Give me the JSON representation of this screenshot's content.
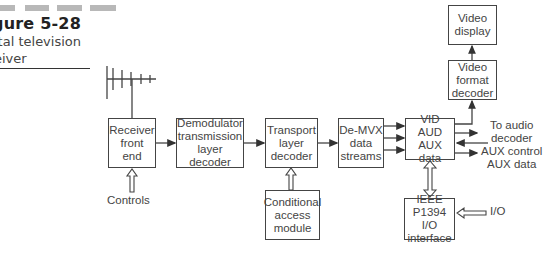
{
  "figure": {
    "title_visible": "gure 5-28",
    "caption_lines": [
      "ital television",
      "eiver"
    ]
  },
  "blocks": {
    "receiver": [
      "Receiver",
      "front",
      "end"
    ],
    "demodulator": [
      "Demodulator",
      "transmission",
      "layer decoder"
    ],
    "transport": [
      "Transport",
      "layer",
      "decoder"
    ],
    "demvx": [
      "De-MVX",
      "data",
      "streams"
    ],
    "vid": [
      "VID",
      "AUD",
      "AUX data"
    ],
    "video_format": [
      "Video",
      "format",
      "decoder"
    ],
    "video_display": [
      "Video",
      "display"
    ],
    "conditional": [
      "Conditional",
      "access",
      "module"
    ],
    "ieee": [
      "IEEE",
      "P1394 I/O",
      "interface"
    ]
  },
  "labels": {
    "controls": "Controls",
    "outputs": [
      "To audio",
      "decoder",
      "AUX control",
      "AUX data"
    ],
    "io": "I/O"
  },
  "colors": {
    "line": "#444444",
    "text": "#444444",
    "header_bar": "#b8b8b8"
  }
}
